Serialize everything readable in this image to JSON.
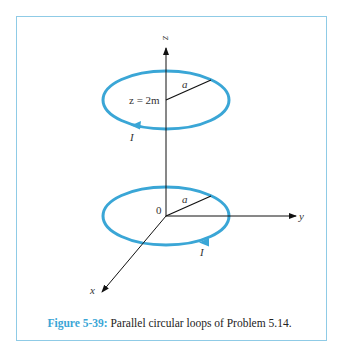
{
  "figure": {
    "number_label": "Figure 5-39:",
    "caption": " Parallel circular loops of Problem 5.14.",
    "loop_color": "#3aa6d6",
    "frame_color": "#8fcbe6"
  },
  "labels": {
    "z_axis": "z",
    "y_axis": "y",
    "x_axis": "x",
    "origin": "0",
    "upper_height": "z = 2m",
    "upper_radius": "a",
    "lower_radius": "a",
    "upper_current": "I",
    "lower_current": "I"
  }
}
